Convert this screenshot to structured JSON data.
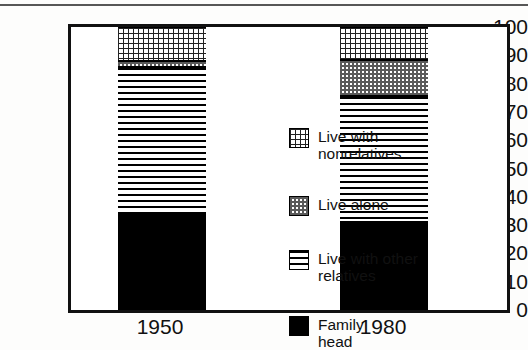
{
  "chart_data": {
    "type": "bar",
    "subtype": "stacked-vertical-percent",
    "title": "",
    "xlabel": "",
    "ylabel": "",
    "categories": [
      "1950",
      "1980"
    ],
    "ylim": [
      0,
      100
    ],
    "yticks": [
      0,
      10,
      20,
      30,
      40,
      50,
      60,
      70,
      80,
      90,
      100
    ],
    "ytick_labels": [
      "0",
      "10",
      "20",
      "30",
      "40",
      "50",
      "60",
      "70",
      "80",
      "90",
      "100"
    ],
    "grid": false,
    "legend_position": "inside-center-right",
    "stack_order_bottom_to_top": [
      "Family head",
      "Live with other relatives",
      "Live alone",
      "Live with nonrelatives"
    ],
    "series": [
      {
        "name": "Family head",
        "pattern": "solid-black",
        "color": "#000000",
        "values": [
          34,
          31
        ]
      },
      {
        "name": "Live with other relatives",
        "pattern": "horizontal-lines",
        "color": "#000000",
        "values": [
          52,
          44.5
        ]
      },
      {
        "name": "Live alone",
        "pattern": "gray-stipple",
        "color": "#9a9a9a",
        "values": [
          2,
          13
        ]
      },
      {
        "name": "Live with nonrelatives",
        "pattern": "fine-dots",
        "color": "#ffffff",
        "values": [
          12,
          11.5
        ]
      }
    ],
    "cumulative_tops": {
      "1950": {
        "Family head": 34,
        "Live with other relatives": 86,
        "Live alone": 88,
        "Live with nonrelatives": 100
      },
      "1980": {
        "Family head": 31,
        "Live with other relatives": 75.5,
        "Live alone": 88.5,
        "Live with nonrelatives": 100
      }
    }
  },
  "legend": {
    "items": [
      {
        "label": "Live with\nnonrelatives",
        "swatch": "fill-dots"
      },
      {
        "label": "Live alone",
        "swatch": "fill-stipple"
      },
      {
        "label": "Live with other\nrelatives",
        "swatch": "fill-hlines"
      },
      {
        "label": "Family\nhead",
        "swatch": "fill-solid"
      }
    ]
  },
  "axis": {
    "y_labels": [
      "100",
      "90",
      "80",
      "70",
      "60",
      "50",
      "40",
      "30",
      "20",
      "10",
      "0"
    ],
    "x_labels": [
      "1950",
      "1980"
    ]
  }
}
